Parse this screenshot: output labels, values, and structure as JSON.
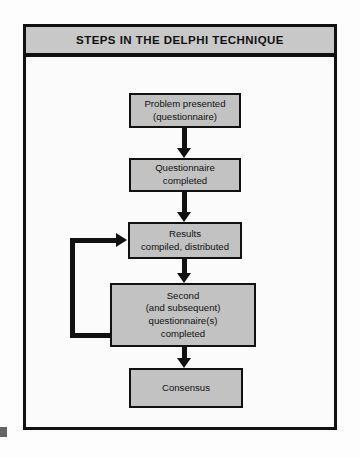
{
  "figure": {
    "title": "STEPS IN THE DELPHI TECHNIQUE",
    "colors": {
      "title_band_fill": "#c8c8c8",
      "box_fill": "#c2c2c2",
      "stroke": "#111111",
      "page_background": "#fdfdfd",
      "frame_background": "#fbfbfb"
    },
    "steps": [
      {
        "id": "problem",
        "name": "problem-presented",
        "line1": "Problem presented",
        "line2": "(questionnaire)"
      },
      {
        "id": "questionnaire",
        "name": "questionnaire-completed",
        "line1": "Questionnaire",
        "line2": "completed"
      },
      {
        "id": "results",
        "name": "results-compiled-distributed",
        "line1": "Results",
        "line2": "compiled, distributed"
      },
      {
        "id": "second",
        "name": "second-questionnaires-completed",
        "line1": "Second",
        "line2": "(and subsequent)",
        "line3": "questionnaire(s)",
        "line4": "completed"
      },
      {
        "id": "consensus",
        "name": "consensus",
        "line1": "Consensus"
      }
    ],
    "connectors": [
      {
        "id": "c1",
        "from": "problem",
        "to": "questionnaire",
        "direction": "down"
      },
      {
        "id": "c2",
        "from": "questionnaire",
        "to": "results",
        "direction": "down"
      },
      {
        "id": "c3",
        "from": "results",
        "to": "second",
        "direction": "down"
      },
      {
        "id": "c4",
        "from": "second",
        "to": "consensus",
        "direction": "down"
      },
      {
        "id": "feedback",
        "from": "second",
        "to": "results",
        "direction": "loop-left-up-right"
      }
    ]
  }
}
